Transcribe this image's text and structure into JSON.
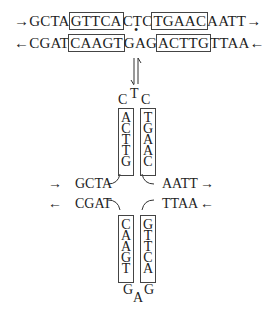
{
  "diagram": {
    "type": "DNA cruciform formation from inverted repeat",
    "linear": {
      "top_strand": {
        "arrow_left": "→",
        "flank_left": "GCTA",
        "repeat_left": "GTTCA",
        "center": "CTC",
        "repeat_right": "TGAAC",
        "flank_right": "AATT",
        "arrow_right": "→"
      },
      "bottom_strand": {
        "arrow_left": "←",
        "flank_left": "CGAT",
        "repeat_left": "CAAGT",
        "center": "GAG",
        "repeat_right": "ACTTG",
        "flank_right": "TTAA",
        "arrow_right": "←"
      },
      "center_marker": "•"
    },
    "equilibrium_arrow": "⇌",
    "cruciform": {
      "top_loop": {
        "left": "C",
        "middle": "T",
        "right": "C"
      },
      "top_stem_left": [
        "A",
        "C",
        "T",
        "T",
        "G"
      ],
      "top_stem_right": [
        "T",
        "G",
        "A",
        "A",
        "C"
      ],
      "upper_strand": {
        "arrow_left": "→",
        "left": "GCTA",
        "right": "AATT",
        "arrow_right": "→"
      },
      "lower_strand": {
        "arrow_left": "←",
        "left": "CGAT",
        "right": "TTAA",
        "arrow_right": "←"
      },
      "bottom_stem_left": [
        "C",
        "A",
        "A",
        "G",
        "T"
      ],
      "bottom_stem_right": [
        "G",
        "T",
        "T",
        "C",
        "A"
      ],
      "bottom_loop": {
        "left": "G",
        "middle": "A",
        "right": "G"
      }
    }
  }
}
